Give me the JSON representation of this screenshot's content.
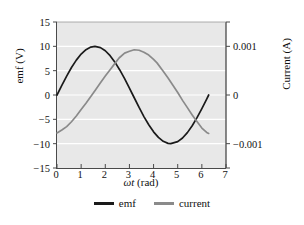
{
  "chart_data": {
    "type": "line",
    "title": "",
    "xlabel": "ωt (rad)",
    "ylabel": "emf (V)",
    "ylabel_right": "Current (A)",
    "xlim": [
      0,
      7
    ],
    "ylim": [
      -15,
      15
    ],
    "ylim_right": [
      -0.0015,
      0.0015
    ],
    "grid": "horizontal-white",
    "legend_position": "bottom-center",
    "xticks": [
      "0",
      "1",
      "2",
      "3",
      "4",
      "5",
      "6",
      "7"
    ],
    "xtick_values": [
      0,
      1,
      2,
      3,
      4,
      5,
      6,
      7
    ],
    "yticks_left": [
      "15",
      "10",
      "5",
      "0",
      "−5",
      "−10",
      "−15"
    ],
    "ytick_values_left": [
      15,
      10,
      5,
      0,
      -5,
      -10,
      -15
    ],
    "yticks_right": [
      "0.001",
      "0",
      "−0.001"
    ],
    "ytick_values_right": [
      0.001,
      0,
      -0.001
    ],
    "series": [
      {
        "name": "emf",
        "axis": "left",
        "color": "#1a1a1a",
        "amplitude": 10,
        "phase": 0,
        "x": [
          0,
          0.2,
          0.4,
          0.6,
          0.8,
          1.0,
          1.2,
          1.4,
          1.571,
          1.8,
          2.0,
          2.2,
          2.4,
          2.6,
          2.8,
          3.0,
          3.142,
          3.4,
          3.6,
          3.8,
          4.0,
          4.2,
          4.4,
          4.6,
          4.712,
          5.0,
          5.2,
          5.4,
          5.6,
          5.8,
          6.0,
          6.2,
          6.283
        ],
        "values": [
          0,
          1.99,
          3.89,
          5.65,
          7.17,
          8.41,
          9.32,
          9.85,
          10.0,
          9.74,
          9.09,
          8.08,
          6.75,
          5.15,
          3.35,
          1.41,
          0,
          -2.56,
          -4.43,
          -6.12,
          -7.57,
          -8.71,
          -9.52,
          -9.94,
          -10.0,
          -9.59,
          -8.83,
          -7.73,
          -6.31,
          -4.65,
          -2.79,
          -0.83,
          0
        ]
      },
      {
        "name": "current",
        "axis": "right",
        "color": "#8a8a8a",
        "amplitude": 0.00093,
        "phase_lag_rad": 1.0,
        "x": [
          0,
          0.2,
          0.4,
          0.6,
          0.8,
          1.0,
          1.2,
          1.4,
          1.6,
          1.8,
          2.0,
          2.2,
          2.4,
          2.571,
          2.8,
          3.0,
          3.2,
          3.4,
          3.6,
          3.8,
          4.0,
          4.142,
          4.4,
          4.6,
          4.8,
          5.0,
          5.2,
          5.4,
          5.6,
          5.712,
          6.0,
          6.2,
          6.283
        ],
        "values": [
          -0.00078,
          -0.00072,
          -0.00065,
          -0.00055,
          -0.00043,
          -0.0003,
          -0.00017,
          -3e-05,
          0.00011,
          0.00025,
          0.00039,
          0.00052,
          0.00065,
          0.00076,
          0.00086,
          0.0009,
          0.00093,
          0.00092,
          0.00088,
          0.00082,
          0.00073,
          0.00066,
          0.00049,
          0.00035,
          0.0002,
          5e-05,
          -0.00011,
          -0.00026,
          -0.00041,
          -0.00049,
          -0.00068,
          -0.00077,
          -0.00079
        ]
      }
    ],
    "legend": [
      {
        "label": "emf",
        "color": "#1a1a1a"
      },
      {
        "label": "current",
        "color": "#8a8a8a"
      }
    ]
  }
}
